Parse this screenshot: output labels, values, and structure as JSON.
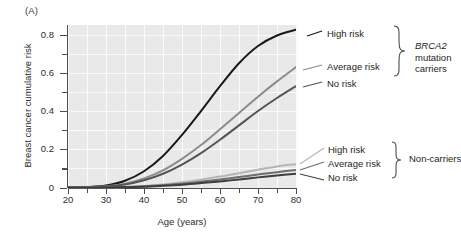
{
  "panel": {
    "label": "(A)"
  },
  "axes": {
    "ylabel": "Breast cancer cumulative risk",
    "xlabel": "Age (years)",
    "ytick_labels": [
      "0",
      "0.2",
      "0.4",
      "0.6",
      "0.8"
    ],
    "xtick_labels": [
      "20",
      "30",
      "40",
      "50",
      "60",
      "70",
      "80"
    ]
  },
  "legend": {
    "carriers": {
      "high": "High risk",
      "average": "Average risk",
      "none": "No risk",
      "group_line1": "BRCA2",
      "group_line2": "mutation",
      "group_line3": "carriers"
    },
    "noncarriers": {
      "high": "High risk",
      "average": "Average risk",
      "none": "No risk",
      "group": "Non-carriers"
    }
  },
  "chart_data": {
    "type": "line",
    "title": "",
    "xlabel": "Age (years)",
    "ylabel": "Breast cancer cumulative risk",
    "xlim": [
      20,
      80
    ],
    "ylim": [
      0,
      0.85
    ],
    "xticks": [
      20,
      25,
      30,
      35,
      40,
      45,
      50,
      55,
      60,
      65,
      70,
      75,
      80
    ],
    "xticks_labeled": [
      20,
      30,
      40,
      50,
      60,
      70,
      80
    ],
    "yticks": [
      0,
      0.1,
      0.2,
      0.3,
      0.4,
      0.5,
      0.6,
      0.7,
      0.8
    ],
    "yticks_labeled": [
      0,
      0.2,
      0.4,
      0.6,
      0.8
    ],
    "grid": true,
    "grid_color": "#fbfbfb",
    "plot_bgcolor": "#e9e9e9",
    "legend_position": "right-outside",
    "x": [
      20,
      25,
      30,
      35,
      40,
      45,
      50,
      55,
      60,
      65,
      70,
      75,
      80
    ],
    "series": [
      {
        "name": "BRCA2 mutation carriers - High risk",
        "group": "BRCA2 mutation carriers",
        "risk": "High risk",
        "color": "#1a1a1a",
        "width": 2.0,
        "values": [
          0.0,
          0.002,
          0.01,
          0.035,
          0.085,
          0.165,
          0.275,
          0.4,
          0.53,
          0.65,
          0.74,
          0.795,
          0.825
        ]
      },
      {
        "name": "BRCA2 mutation carriers - Average risk",
        "group": "BRCA2 mutation carriers",
        "risk": "Average risk",
        "color": "#8c8c8c",
        "width": 2.0,
        "values": [
          0.0,
          0.001,
          0.006,
          0.02,
          0.048,
          0.09,
          0.15,
          0.222,
          0.305,
          0.39,
          0.475,
          0.555,
          0.63
        ]
      },
      {
        "name": "BRCA2 mutation carriers - No risk",
        "group": "BRCA2 mutation carriers",
        "risk": "No risk",
        "color": "#545454",
        "width": 2.0,
        "values": [
          0.0,
          0.001,
          0.005,
          0.016,
          0.038,
          0.072,
          0.12,
          0.18,
          0.25,
          0.325,
          0.4,
          0.468,
          0.53
        ]
      },
      {
        "name": "Non-carriers - High risk",
        "group": "Non-carriers",
        "risk": "High risk",
        "color": "#b5b5b5",
        "width": 2.0,
        "values": [
          0.0,
          0.0,
          0.001,
          0.003,
          0.008,
          0.016,
          0.027,
          0.041,
          0.057,
          0.075,
          0.093,
          0.11,
          0.122
        ]
      },
      {
        "name": "Non-carriers - Average risk",
        "group": "Non-carriers",
        "risk": "Average risk",
        "color": "#6e6e6e",
        "width": 2.0,
        "values": [
          0.0,
          0.0,
          0.001,
          0.002,
          0.006,
          0.012,
          0.02,
          0.03,
          0.042,
          0.055,
          0.068,
          0.08,
          0.092
        ]
      },
      {
        "name": "Non-carriers - No risk",
        "group": "Non-carriers",
        "risk": "No risk",
        "color": "#3d3d3d",
        "width": 2.0,
        "values": [
          0.0,
          0.0,
          0.001,
          0.002,
          0.004,
          0.009,
          0.015,
          0.023,
          0.032,
          0.042,
          0.053,
          0.063,
          0.072
        ]
      }
    ]
  }
}
